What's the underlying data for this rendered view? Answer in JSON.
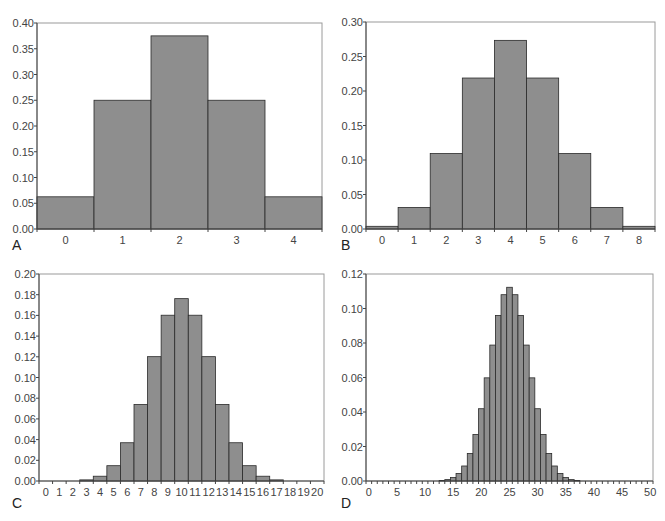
{
  "chart_data": [
    {
      "panel": "A",
      "type": "bar",
      "title": "",
      "xlabel": "",
      "ylabel": "",
      "categories": [
        0,
        1,
        2,
        3,
        4
      ],
      "values": [
        0.0625,
        0.25,
        0.375,
        0.25,
        0.0625
      ],
      "ylim": [
        0,
        0.4
      ],
      "yticks": [
        "0.00",
        "0.05",
        "0.10",
        "0.15",
        "0.20",
        "0.25",
        "0.30",
        "0.35",
        "0.40"
      ],
      "xticks": [
        "0",
        "1",
        "2",
        "3",
        "4"
      ],
      "xlabel_step": 1,
      "grid": false,
      "frame": {
        "left": 37,
        "top": 23,
        "right": 322,
        "bottom": 229
      },
      "letter_pos": {
        "x": 12,
        "y": 250
      }
    },
    {
      "panel": "B",
      "type": "bar",
      "title": "",
      "xlabel": "",
      "ylabel": "",
      "categories": [
        0,
        1,
        2,
        3,
        4,
        5,
        6,
        7,
        8
      ],
      "values": [
        0.0039,
        0.0313,
        0.1094,
        0.2188,
        0.2734,
        0.2188,
        0.1094,
        0.0313,
        0.0039
      ],
      "ylim": [
        0,
        0.3
      ],
      "yticks": [
        "0.00",
        "0.05",
        "0.10",
        "0.15",
        "0.20",
        "0.25",
        "0.30"
      ],
      "xticks": [
        "0",
        "1",
        "2",
        "3",
        "4",
        "5",
        "6",
        "7",
        "8"
      ],
      "xlabel_step": 1,
      "grid": false,
      "frame": {
        "left": 366,
        "top": 22,
        "right": 655,
        "bottom": 229
      },
      "letter_pos": {
        "x": 341,
        "y": 250
      }
    },
    {
      "panel": "C",
      "type": "bar",
      "title": "",
      "xlabel": "",
      "ylabel": "",
      "categories": [
        0,
        1,
        2,
        3,
        4,
        5,
        6,
        7,
        8,
        9,
        10,
        11,
        12,
        13,
        14,
        15,
        16,
        17,
        18,
        19,
        20
      ],
      "values": [
        1e-06,
        1.9e-05,
        0.000181,
        0.001087,
        0.004621,
        0.014786,
        0.036964,
        0.073929,
        0.120134,
        0.160179,
        0.176197,
        0.160179,
        0.120134,
        0.073929,
        0.036964,
        0.014786,
        0.004621,
        0.001087,
        0.000181,
        1.9e-05,
        1e-06
      ],
      "ylim": [
        0,
        0.2
      ],
      "yticks": [
        "0.00",
        "0.02",
        "0.04",
        "0.06",
        "0.08",
        "0.10",
        "0.12",
        "0.14",
        "0.16",
        "0.18",
        "0.20"
      ],
      "xticks": [
        "0",
        "1",
        "2",
        "3",
        "4",
        "5",
        "6",
        "7",
        "8",
        "9",
        "10",
        "11",
        "12",
        "13",
        "14",
        "15",
        "16",
        "17",
        "18",
        "19",
        "20"
      ],
      "xlabel_step": 1,
      "grid": false,
      "frame": {
        "left": 39,
        "top": 274,
        "right": 324,
        "bottom": 481
      },
      "letter_pos": {
        "x": 12,
        "y": 508
      }
    },
    {
      "panel": "D",
      "type": "bar",
      "title": "",
      "xlabel": "",
      "ylabel": "",
      "categories": [
        0,
        1,
        2,
        3,
        4,
        5,
        6,
        7,
        8,
        9,
        10,
        11,
        12,
        13,
        14,
        15,
        16,
        17,
        18,
        19,
        20,
        21,
        22,
        23,
        24,
        25,
        26,
        27,
        28,
        29,
        30,
        31,
        32,
        33,
        34,
        35,
        36,
        37,
        38,
        39,
        40,
        41,
        42,
        43,
        44,
        45,
        46,
        47,
        48,
        49,
        50
      ],
      "values": [
        0,
        0,
        0,
        0,
        0,
        0,
        0,
        0,
        0,
        0,
        0,
        0,
        0.0001,
        0.0003,
        0.0008,
        0.002,
        0.0044,
        0.0087,
        0.016,
        0.027,
        0.0419,
        0.0598,
        0.0788,
        0.096,
        0.108,
        0.1123,
        0.108,
        0.096,
        0.0788,
        0.0598,
        0.0419,
        0.027,
        0.016,
        0.0087,
        0.0044,
        0.002,
        0.0008,
        0.0003,
        0.0001,
        0,
        0,
        0,
        0,
        0,
        0,
        0,
        0,
        0,
        0,
        0,
        0
      ],
      "ylim": [
        0,
        0.12
      ],
      "yticks": [
        "0.00",
        "0.02",
        "0.04",
        "0.06",
        "0.08",
        "0.10",
        "0.12"
      ],
      "xticks": [
        "0",
        "5",
        "10",
        "15",
        "20",
        "25",
        "30",
        "35",
        "40",
        "45",
        "50"
      ],
      "xlabel_step": 5,
      "grid": false,
      "frame": {
        "left": 366,
        "top": 274,
        "right": 653,
        "bottom": 481
      },
      "letter_pos": {
        "x": 341,
        "y": 508
      }
    }
  ]
}
